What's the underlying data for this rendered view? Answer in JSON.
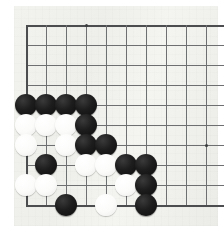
{
  "figure": {
    "game": "Go",
    "view": "top-left corner of board"
  },
  "board": {
    "background_color": "#f0f0ec",
    "line_color": "#6d6f70",
    "edge_line_color": "#4b4d4e",
    "black_stone_color": "#131313",
    "white_stone_color": "#fafafa",
    "origin_x": 26,
    "origin_y": 25,
    "spacing": 20,
    "columns": 10,
    "rows": 10,
    "stone_diameter": 22,
    "edges": [
      "left",
      "top",
      "bottom"
    ],
    "star_points": [
      {
        "x": 86,
        "y": 25
      },
      {
        "x": 206,
        "y": 145
      }
    ],
    "grid_lines_vertical": [
      26,
      46,
      66,
      86,
      106,
      126,
      146,
      166,
      186,
      206
    ],
    "grid_lines_horizontal": [
      25,
      45,
      65,
      85,
      105,
      125,
      145,
      165,
      185,
      205
    ]
  },
  "stones": [
    {
      "color": "black",
      "col": 0,
      "row": 4,
      "x": 26,
      "y": 105
    },
    {
      "color": "black",
      "col": 1,
      "row": 4,
      "x": 46,
      "y": 105
    },
    {
      "color": "black",
      "col": 2,
      "row": 4,
      "x": 66,
      "y": 105
    },
    {
      "color": "black",
      "col": 3,
      "row": 4,
      "x": 86,
      "y": 105
    },
    {
      "color": "white",
      "col": 0,
      "row": 5,
      "x": 26,
      "y": 125
    },
    {
      "color": "white",
      "col": 1,
      "row": 5,
      "x": 46,
      "y": 125
    },
    {
      "color": "white",
      "col": 2,
      "row": 5,
      "x": 66,
      "y": 125
    },
    {
      "color": "black",
      "col": 3,
      "row": 5,
      "x": 86,
      "y": 125
    },
    {
      "color": "white",
      "col": 0,
      "row": 6,
      "x": 26,
      "y": 145
    },
    {
      "color": "white",
      "col": 2,
      "row": 6,
      "x": 66,
      "y": 145
    },
    {
      "color": "black",
      "col": 3,
      "row": 6,
      "x": 86,
      "y": 145
    },
    {
      "color": "black",
      "col": 4,
      "row": 6,
      "x": 106,
      "y": 145
    },
    {
      "color": "black",
      "col": 1,
      "row": 7,
      "x": 46,
      "y": 165
    },
    {
      "color": "white",
      "col": 3,
      "row": 7,
      "x": 86,
      "y": 165
    },
    {
      "color": "white",
      "col": 4,
      "row": 7,
      "x": 106,
      "y": 165
    },
    {
      "color": "black",
      "col": 5,
      "row": 7,
      "x": 126,
      "y": 165
    },
    {
      "color": "black",
      "col": 6,
      "row": 7,
      "x": 146,
      "y": 165
    },
    {
      "color": "white",
      "col": 0,
      "row": 8,
      "x": 26,
      "y": 185
    },
    {
      "color": "white",
      "col": 1,
      "row": 8,
      "x": 46,
      "y": 185
    },
    {
      "color": "white",
      "col": 5,
      "row": 8,
      "x": 126,
      "y": 185
    },
    {
      "color": "black",
      "col": 6,
      "row": 8,
      "x": 146,
      "y": 185
    },
    {
      "color": "black",
      "col": 2,
      "row": 9,
      "x": 66,
      "y": 205
    },
    {
      "color": "white",
      "col": 4,
      "row": 9,
      "x": 106,
      "y": 205
    },
    {
      "color": "black",
      "col": 6,
      "row": 9,
      "x": 146,
      "y": 205
    }
  ]
}
